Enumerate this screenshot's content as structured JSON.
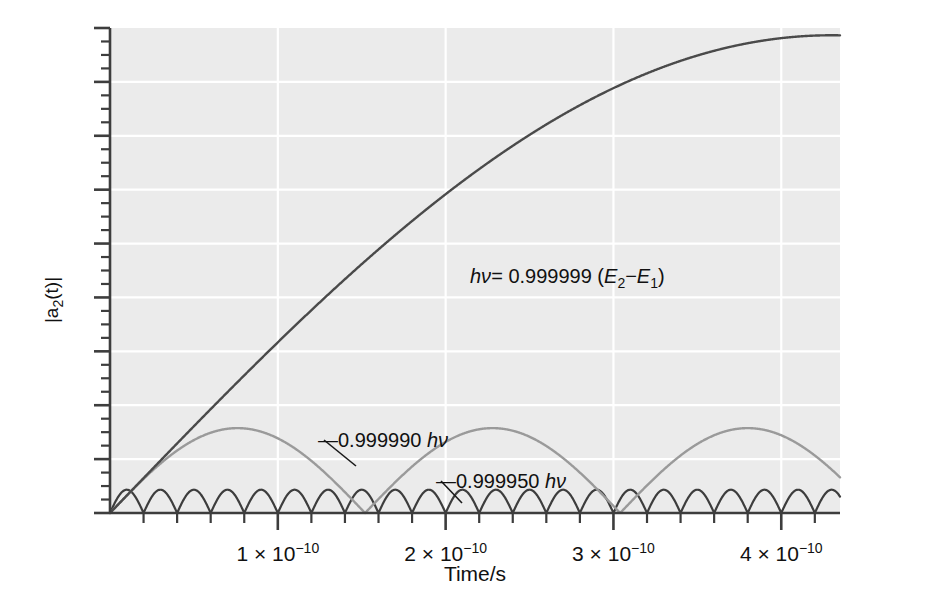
{
  "figure": {
    "background_color": "#ffffff",
    "plot_background_color": "#ebebeb",
    "gridline_color": "#ffffff",
    "axis_color": "#3d3d3d"
  },
  "axes": {
    "y": {
      "label": "|a",
      "label_sub": "2",
      "label_rest": "(t)|",
      "label_full": "|a2(t)|",
      "major_tick_count": 9,
      "minor_per_major": 4,
      "range": [
        0,
        1.0
      ],
      "ticks_labeled": false
    },
    "x": {
      "title": "Time/s",
      "range_min": 0,
      "range_max": 4.35e-10,
      "unit_exponent": "-10",
      "ticks": [
        {
          "mantissa": "1",
          "times": "×",
          "base": "10",
          "exponent": "−10",
          "value": 1e-10
        },
        {
          "mantissa": "2",
          "times": "×",
          "base": "10",
          "exponent": "−10",
          "value": 2e-10
        },
        {
          "mantissa": "3",
          "times": "×",
          "base": "10",
          "exponent": "−10",
          "value": 3e-10
        },
        {
          "mantissa": "4",
          "times": "×",
          "base": "10",
          "exponent": "−10",
          "value": 4e-10
        }
      ],
      "minor_per_major": 5
    }
  },
  "annotations": [
    {
      "id": "main-curve-label",
      "prefix_italic": "hν",
      "equals": "= ",
      "value": "0.999999 ",
      "paren_open": "(",
      "e2": "E",
      "e2_sub": "2",
      "minus": "−",
      "e1": "E",
      "e1_sub": "1",
      "paren_close": ")",
      "full_text": "hν= 0.999999 (E2−E1)",
      "x": 470,
      "y": 283,
      "has_leader": false
    },
    {
      "id": "medium-curve-label",
      "dash": "—",
      "value": "0.999990 ",
      "unit_italic": "hν",
      "full_text": "— 0.999990 hν",
      "x": 318,
      "y": 444,
      "has_leader": true,
      "leader_from_x": 356,
      "leader_from_y": 466,
      "leader_to_x": 321,
      "leader_to_y": 440
    },
    {
      "id": "fast-curve-label",
      "dash": "—",
      "value": "0.999950 ",
      "unit_italic": "hν",
      "full_text": "— 0.999950 hν",
      "x": 437,
      "y": 485,
      "has_leader": true,
      "leader_from_x": 462,
      "leader_from_y": 503,
      "leader_to_x": 440,
      "leader_to_y": 481
    }
  ],
  "chart_data": {
    "type": "line",
    "title": "",
    "xlabel": "Time/s",
    "ylabel": "|a2(t)|",
    "xlim": [
      0,
      4.35e-10
    ],
    "ylim": [
      0,
      1.0
    ],
    "grid": true,
    "legend_position": "inline-annotations",
    "x_tick_values": [
      1e-10,
      2e-10,
      3e-10,
      4e-10
    ],
    "x_tick_labels": [
      "1 × 10⁻¹⁰",
      "2 × 10⁻¹⁰",
      "3 × 10⁻¹⁰",
      "4 × 10⁻¹⁰"
    ],
    "y_tick_labels": [],
    "series": [
      {
        "name": "hν= 0.999999 (E2−E1)",
        "label": "0.999999",
        "color": "#4a4a4a",
        "linewidth": 2.4,
        "amplitude": 0.985,
        "half_period_s": 8.6e-10,
        "form": "abs_sine",
        "comment": "Near-resonant: only the first rising quarter-cycle is visible within the plotted window; reaches ~0.96 at t = 4e-10 s.",
        "points_t": [
          0,
          5e-11,
          1e-10,
          1.5e-10,
          2e-10,
          2.5e-10,
          3e-10,
          3.5e-10,
          4e-10,
          4.2e-10
        ],
        "points_y": [
          0.0,
          0.182,
          0.358,
          0.522,
          0.668,
          0.791,
          0.886,
          0.951,
          0.985,
          0.991
        ]
      },
      {
        "name": "0.999990 hν",
        "label": "0.999990",
        "color": "#9a9a9a",
        "linewidth": 2.4,
        "amplitude": 0.175,
        "half_period_s": 1.52e-10,
        "form": "abs_sine",
        "comment": "Moderate detuning: rectified sinusoid with zeros near t = 1.52e-10 and 3.05e-10 s, peak height about 0.175.",
        "points_t": [
          0,
          3.8e-11,
          7.6e-11,
          1.14e-10,
          1.52e-10,
          1.9e-10,
          2.28e-10,
          2.66e-10,
          3.05e-10,
          3.43e-10,
          3.81e-10,
          4.2e-10
        ],
        "points_y": [
          0.0,
          0.124,
          0.175,
          0.124,
          0.0,
          0.124,
          0.175,
          0.124,
          0.0,
          0.124,
          0.175,
          0.16
        ]
      },
      {
        "name": "0.999950 hν",
        "label": "0.999950",
        "color": "#3d3d3d",
        "linewidth": 2.2,
        "amplitude": 0.048,
        "half_period_s": 2e-11,
        "form": "abs_sine",
        "comment": "Largest detuning: fast, low-amplitude rectified oscillation, about 21 lobes across the window, peak height about 0.048.",
        "lobe_count": 21,
        "points_t": [
          0,
          1e-11,
          2e-11,
          3e-11,
          4e-11,
          5e-11,
          6e-11
        ],
        "points_y": [
          0.0,
          0.048,
          0.0,
          0.048,
          0.0,
          0.048,
          0.0
        ]
      }
    ]
  }
}
